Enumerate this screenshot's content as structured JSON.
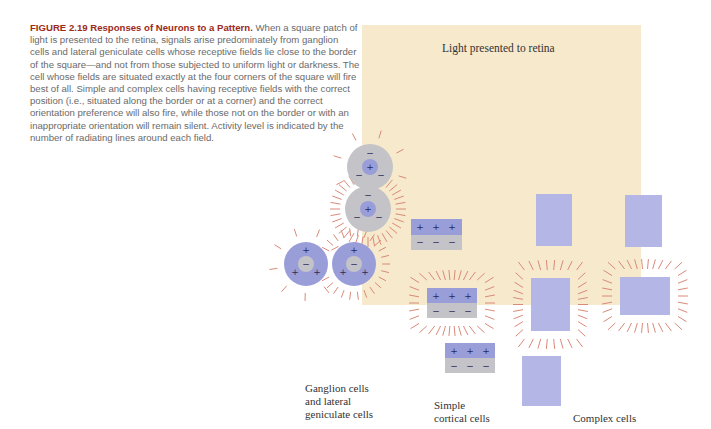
{
  "caption": {
    "label": "FIGURE 2.19 Responses of Neurons to a Pattern.",
    "text": "When a square patch of light is presented to the retina, signals arise predominately from ganglion cells and lateral geniculate cells whose receptive fields lie close to the border of the square—and not from those subjected to uniform light or darkness. The cell whose fields are situated exactly at the four corners of the square will fire best of all. Simple and complex cells having receptive fields with the correct position (i.e., situated along the border or at a corner) and the correct orientation preference will also fire, while those not on the border or with an inappropriate orientation will remain silent. Activity level is indicated by the number of radiating lines around each field."
  },
  "figure": {
    "light_label": "Light presented to retina",
    "column_labels": {
      "ganglion_line1": "Ganglion cells",
      "ganglion_line2": "and lateral",
      "ganglion_line3": "geniculate cells",
      "simple_line1": "Simple",
      "simple_line2": "cortical cells",
      "complex": "Complex cells"
    },
    "colors": {
      "light_square": "#f6e9cc",
      "on_region": "#9a9ed8",
      "off_region": "#c4c4c8",
      "complex_field": "#b4b6e6",
      "activity_lines": "#d98a78",
      "caption_title": "#9c2a1c"
    },
    "symbols": {
      "plus": "+",
      "minus": "−"
    }
  }
}
